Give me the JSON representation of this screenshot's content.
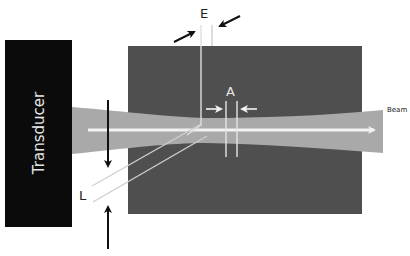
{
  "labels": {
    "transducer": "Transducer",
    "beam": "Beam",
    "elevational": "E",
    "axial": "A",
    "lateral": "L"
  },
  "colors": {
    "transducer": "#0b0b0b",
    "tissue_block": "#4f4f4f",
    "beam": "#a9a9a9",
    "axis_line": "#f2f2f2",
    "arrow": "#111111",
    "text_dark": "#222222",
    "text_light": "#e6e6e6"
  }
}
